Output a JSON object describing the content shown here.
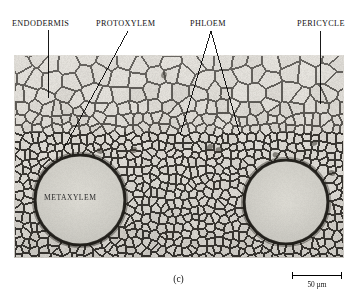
{
  "figure": {
    "caption": "(c)"
  },
  "callouts": [
    {
      "id": "endodermis",
      "label": "ENDODERMIS",
      "leader": "vertical-line",
      "label_x": 12,
      "label_y": 20,
      "lines": [
        [
          48,
          30,
          48,
          98
        ]
      ]
    },
    {
      "id": "protoxylem",
      "label": "PROTOXYLEM",
      "leader": "diagonal-line",
      "label_x": 96,
      "label_y": 20,
      "lines": [
        [
          128,
          31,
          64,
          148
        ]
      ]
    },
    {
      "id": "phloem",
      "label": "PHLOEM",
      "leader": "v-shaped-double-line",
      "label_x": 190,
      "label_y": 20,
      "lines": [
        [
          211,
          31,
          180,
          135
        ],
        [
          211,
          31,
          240,
          135
        ]
      ]
    },
    {
      "id": "pericycle",
      "label": "PERICYCLE",
      "leader": "vertical-line",
      "label_x": 297,
      "label_y": 20,
      "lines": [
        [
          320,
          31,
          320,
          104
        ]
      ]
    }
  ],
  "inset_labels": [
    {
      "id": "metaxylem",
      "label": "METAXYLEM"
    }
  ],
  "scale_bar": {
    "value": "50",
    "unit": "µm",
    "text": "50 µm",
    "length_px": 50
  },
  "micrograph": {
    "frame": {
      "x": 14,
      "y": 55,
      "width": 330,
      "height": 203
    },
    "background_hex": "#c9c6c0",
    "cell_wall_hex": "#2a2723",
    "lumen_light_hex": "#d8d5cf",
    "lumen_dark_hex": "#a9a59e",
    "vessels": [
      {
        "name": "metaxylem-left",
        "cx": 66,
        "cy": 145,
        "r": 45
      },
      {
        "name": "metaxylem-right",
        "cx": 272,
        "cy": 147,
        "r": 42
      }
    ],
    "zones": [
      {
        "name": "cortex",
        "label": "large thin-walled cortical cells",
        "y_from": 0,
        "y_to": 48
      },
      {
        "name": "endodermis",
        "label": "single ring of endodermal cells",
        "y_from": 48,
        "y_to": 62
      },
      {
        "name": "pericycle",
        "label": "pericycle layer",
        "y_from": 62,
        "y_to": 74
      },
      {
        "name": "vascular",
        "label": "xylem and phloem tissue",
        "y_from": 74,
        "y_to": 203
      }
    ]
  },
  "colors": {
    "text": "#111111",
    "leader_line": "#000000",
    "page_background": "#ffffff"
  }
}
